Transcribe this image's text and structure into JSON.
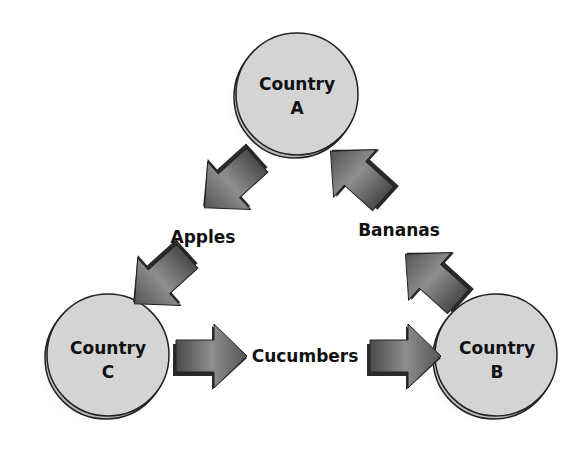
{
  "diagram": {
    "type": "trade-triangle",
    "colors": {
      "node_fill": "#d4d4d4",
      "node_stroke": "#222222",
      "node_shadow": "#e2e2e2",
      "arrow_light": "#a8a8a8",
      "arrow_dark": "#4a4a4a",
      "arrow_side": "#2a2a2a"
    },
    "nodes": [
      {
        "id": "A",
        "line1": "Country",
        "line2": "A"
      },
      {
        "id": "B",
        "line1": "Country",
        "line2": "B"
      },
      {
        "id": "C",
        "line1": "Country",
        "line2": "C"
      }
    ],
    "flows": [
      {
        "from": "A",
        "to": "C",
        "label": "Apples"
      },
      {
        "from": "C",
        "to": "B",
        "label": "Cucumbers"
      },
      {
        "from": "B",
        "to": "A",
        "label": "Bananas"
      }
    ]
  }
}
